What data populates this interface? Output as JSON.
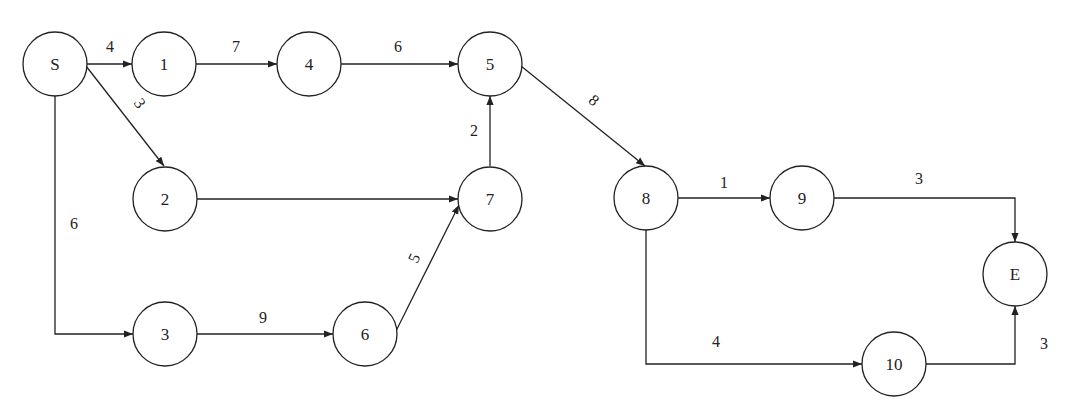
{
  "diagram": {
    "type": "network-graph",
    "nodes": [
      {
        "id": "S",
        "label": "S",
        "x": 55,
        "y": 64
      },
      {
        "id": "1",
        "label": "1",
        "x": 164,
        "y": 64
      },
      {
        "id": "4",
        "label": "4",
        "x": 309,
        "y": 64
      },
      {
        "id": "5",
        "label": "5",
        "x": 490,
        "y": 64
      },
      {
        "id": "2",
        "label": "2",
        "x": 165,
        "y": 199
      },
      {
        "id": "7",
        "label": "7",
        "x": 490,
        "y": 199
      },
      {
        "id": "3",
        "label": "3",
        "x": 165,
        "y": 334
      },
      {
        "id": "6",
        "label": "6",
        "x": 365,
        "y": 334
      },
      {
        "id": "8",
        "label": "8",
        "x": 646,
        "y": 198
      },
      {
        "id": "9",
        "label": "9",
        "x": 802,
        "y": 198
      },
      {
        "id": "E",
        "label": "E",
        "x": 1015,
        "y": 274
      },
      {
        "id": "10",
        "label": "10",
        "x": 894,
        "y": 364
      }
    ],
    "edges": [
      {
        "from": "S",
        "to": "1",
        "weight": "4"
      },
      {
        "from": "1",
        "to": "4",
        "weight": "7"
      },
      {
        "from": "4",
        "to": "5",
        "weight": "6"
      },
      {
        "from": "S",
        "to": "2",
        "weight": "3"
      },
      {
        "from": "S",
        "to": "3",
        "weight": "6"
      },
      {
        "from": "2",
        "to": "7",
        "weight": ""
      },
      {
        "from": "7",
        "to": "5",
        "weight": "2"
      },
      {
        "from": "3",
        "to": "6",
        "weight": "9"
      },
      {
        "from": "6",
        "to": "7",
        "weight": "5"
      },
      {
        "from": "5",
        "to": "8",
        "weight": "8"
      },
      {
        "from": "8",
        "to": "9",
        "weight": "1"
      },
      {
        "from": "9",
        "to": "E",
        "weight": "3"
      },
      {
        "from": "8",
        "to": "10",
        "weight": "4"
      },
      {
        "from": "10",
        "to": "E",
        "weight": "3"
      }
    ]
  },
  "labels": {
    "nodes": {
      "S": "S",
      "n1": "1",
      "n2": "2",
      "n3": "3",
      "n4": "4",
      "n5": "5",
      "n6": "6",
      "n7": "7",
      "n8": "8",
      "n9": "9",
      "n10": "10",
      "E": "E"
    },
    "edges": {
      "S_1": "4",
      "n1_4": "7",
      "n4_5": "6",
      "S_2": "3",
      "S_3": "6",
      "n7_5": "2",
      "n3_6": "9",
      "n6_7": "5",
      "n5_8": "8",
      "n8_9": "1",
      "n9_E": "3",
      "n8_10": "4",
      "n10_E": "3"
    }
  }
}
